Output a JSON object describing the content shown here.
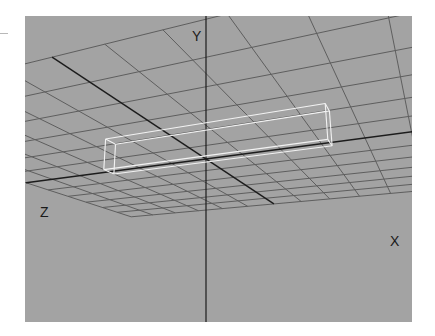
{
  "viewport": {
    "view": "perspective",
    "background_color": "#a3a3a3",
    "grid_color": "#5e5e5e",
    "axis_color": "#1c1c1c",
    "object_color": "#f2f2f2",
    "axis_labels": {
      "y": "Y",
      "z": "Z",
      "x": "X"
    }
  },
  "scene": {
    "grid": {
      "extent": 6,
      "divisions": 12
    },
    "object": {
      "type": "box",
      "display": "wireframe",
      "min": [
        -3.0,
        0.0,
        -0.25
      ],
      "max": [
        3.2,
        0.9,
        0.25
      ]
    }
  }
}
